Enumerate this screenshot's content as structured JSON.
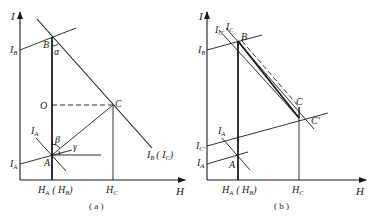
{
  "panels": [
    {
      "id": "a",
      "caption": "( a )",
      "axes": {
        "x_label": "H",
        "y_label": "I"
      },
      "points": {
        "A": "A",
        "B": "B",
        "C": "C",
        "O": "O"
      },
      "line_labels": {
        "I_B_left": "I",
        "I_B_left_sub": "B",
        "I_A_left": "I",
        "I_A_left_sub": "A",
        "I_A_upper": "I",
        "I_A_upper_sub": "A",
        "IB_IC": "I",
        "IB_IC_sub1": "B",
        "IB_IC_mid": "( I",
        "IB_IC_sub2": "C",
        "IB_IC_end": ")"
      },
      "angles": {
        "alpha": "α",
        "beta": "β",
        "gamma": "γ"
      },
      "ticks": {
        "HA": "H",
        "HA_sub": "A",
        "HB_open": "( H",
        "HB_sub": "B",
        "HB_close": ")",
        "HC": "H",
        "HC_sub": "C"
      }
    },
    {
      "id": "b",
      "caption": "( b )",
      "axes": {
        "x_label": "H",
        "y_label": "I"
      },
      "points": {
        "A": "A",
        "B": "B",
        "C": "C",
        "C_prime": "C′"
      },
      "line_labels": {
        "I_B_left": "I",
        "I_B_left_sub": "B",
        "I_Cprime_left": "I",
        "I_Cprime_left_sub": "C′",
        "I_A_left": "I",
        "I_A_left_sub": "A",
        "I_A_upper": "I",
        "I_A_upper_sub": "A",
        "I_C_top1": "I",
        "I_C_top1_sub": "C′",
        "I_C_top2": "I",
        "I_C_top2_sub": "C"
      },
      "ticks": {
        "HA": "H",
        "HA_sub": "A",
        "HB_open": "( H",
        "HB_sub": "B",
        "HB_close": ")",
        "HC": "H",
        "HC_sub": "C"
      }
    }
  ]
}
